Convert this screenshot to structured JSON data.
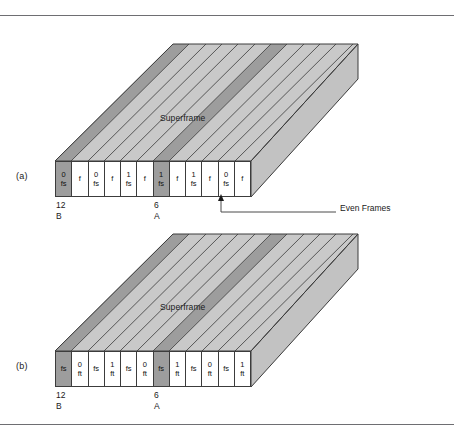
{
  "figure": {
    "panels": [
      {
        "id": "a",
        "label": "(a)",
        "top_face_label": "Superframe",
        "cells": [
          {
            "line1": "0",
            "line2": "fs",
            "shaded": true
          },
          {
            "line1": "",
            "line2": "f",
            "shaded": false
          },
          {
            "line1": "0",
            "line2": "fs",
            "shaded": false
          },
          {
            "line1": "",
            "line2": "f",
            "shaded": false
          },
          {
            "line1": "1",
            "line2": "fs",
            "shaded": false
          },
          {
            "line1": "",
            "line2": "f",
            "shaded": false
          },
          {
            "line1": "1",
            "line2": "fs",
            "shaded": true
          },
          {
            "line1": "",
            "line2": "f",
            "shaded": false
          },
          {
            "line1": "1",
            "line2": "fs",
            "shaded": false
          },
          {
            "line1": "",
            "line2": "f",
            "shaded": false
          },
          {
            "line1": "0",
            "line2": "fs",
            "shaded": false
          },
          {
            "line1": "",
            "line2": "f",
            "shaded": false
          }
        ],
        "ticks": [
          {
            "number": "12",
            "letter": "B"
          },
          {
            "number": "6",
            "letter": "A"
          }
        ],
        "callout": {
          "text": "Even Frames"
        }
      },
      {
        "id": "b",
        "label": "(b)",
        "top_face_label": "Superframe",
        "cells": [
          {
            "line1": "",
            "line2": "fs",
            "shaded": true
          },
          {
            "line1": "0",
            "line2": "ft",
            "shaded": false
          },
          {
            "line1": "",
            "line2": "fs",
            "shaded": false
          },
          {
            "line1": "1",
            "line2": "ft",
            "shaded": false
          },
          {
            "line1": "",
            "line2": "fs",
            "shaded": false
          },
          {
            "line1": "0",
            "line2": "ft",
            "shaded": false
          },
          {
            "line1": "",
            "line2": "fs",
            "shaded": true
          },
          {
            "line1": "1",
            "line2": "ft",
            "shaded": false
          },
          {
            "line1": "",
            "line2": "fs",
            "shaded": false
          },
          {
            "line1": "0",
            "line2": "ft",
            "shaded": false
          },
          {
            "line1": "",
            "line2": "fs",
            "shaded": false
          },
          {
            "line1": "1",
            "line2": "ft",
            "shaded": false
          }
        ],
        "ticks": [
          {
            "number": "12",
            "letter": "B"
          },
          {
            "number": "6",
            "letter": "A"
          }
        ],
        "callout": null
      }
    ],
    "colors": {
      "stripe_light": "#c9c9c9",
      "stripe_dark": "#9d9d9d",
      "outline": "#3c3c3c",
      "rule": "#6e6e72",
      "side_face": "#c2c2c2"
    }
  }
}
